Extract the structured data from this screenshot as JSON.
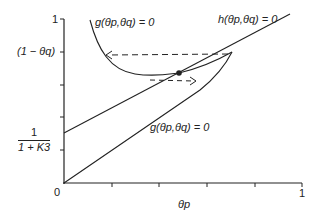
{
  "diagram": {
    "type": "phase-plane",
    "axes": {
      "x_label": "θp",
      "x_label_main": "θ",
      "x_label_sub": "p",
      "x_min_label": "0",
      "x_max_label": "1",
      "y_max_label": "1",
      "y_tick_label_upper": "(1 − θq)",
      "y_tick_label_lower_num": "1",
      "y_tick_label_lower_den": "1 + K3"
    },
    "curves": {
      "g_upper_label": "g(θp,θq) = 0",
      "g_lower_label": "g(θp,θq) = 0",
      "h_label": "h(θp,θq) = 0"
    },
    "annotations": {
      "equilibrium_point": "filled-dot",
      "upper_arrow": "dashed-arrow-left",
      "lower_arrow": "dashed-arrow-right"
    },
    "colors": {
      "line": "#222222",
      "background": "#ffffff"
    }
  }
}
